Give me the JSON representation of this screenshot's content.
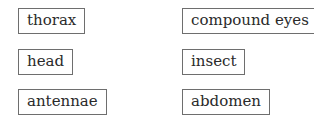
{
  "word_bank": {
    "left_column": [
      {
        "label": "thorax"
      },
      {
        "label": "head"
      },
      {
        "label": "antennae"
      }
    ],
    "right_column": [
      {
        "label": "compound eyes"
      },
      {
        "label": "insect"
      },
      {
        "label": "abdomen"
      }
    ]
  }
}
